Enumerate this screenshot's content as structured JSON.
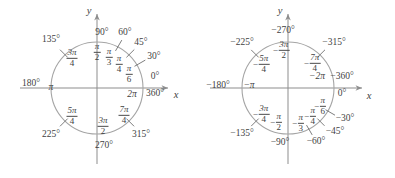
{
  "document": {
    "title": "Unit circle angle measures: positive and negative",
    "background_color": "#ffffff",
    "ink_color": "#3f3f3f",
    "circle_color": "#9a9a9a"
  },
  "figures": [
    {
      "id": "positive-angles",
      "name": "unit-circle-positive-angles",
      "center": {
        "x": 97,
        "y": 88
      },
      "radius": 46,
      "axis_labels": {
        "x": "x",
        "y": "y"
      },
      "points": [
        {
          "degrees": "0°",
          "radians_num": "2",
          "radians_den": "",
          "radians_plain": "2π",
          "angle": 0
        },
        {
          "degrees": "360°",
          "radians_num": "",
          "radians_den": "",
          "radians_plain": "",
          "angle": 0
        },
        {
          "degrees": "30°",
          "radians_num": "π",
          "radians_den": "6",
          "angle": 30
        },
        {
          "degrees": "45°",
          "radians_num": "π",
          "radians_den": "4",
          "angle": 45
        },
        {
          "degrees": "60°",
          "radians_num": "π",
          "radians_den": "3",
          "angle": 60
        },
        {
          "degrees": "90°",
          "radians_num": "π",
          "radians_den": "2",
          "angle": 90
        },
        {
          "degrees": "135°",
          "radians_num": "3π",
          "radians_den": "4",
          "angle": 135
        },
        {
          "degrees": "180°",
          "radians_plain": "π",
          "angle": 180
        },
        {
          "degrees": "225°",
          "radians_num": "5π",
          "radians_den": "4",
          "angle": 225
        },
        {
          "degrees": "270°",
          "radians_num": "3π",
          "radians_den": "2",
          "angle": 270
        },
        {
          "degrees": "315°",
          "radians_num": "7π",
          "radians_den": "4",
          "angle": 315
        }
      ],
      "labels": {
        "deg_0": "0°",
        "deg_30": "30°",
        "deg_45": "45°",
        "deg_60": "60°",
        "deg_90": "90°",
        "deg_135": "135°",
        "deg_180": "180°",
        "deg_225": "225°",
        "deg_270": "270°",
        "deg_315": "315°",
        "deg_360": "360°",
        "rad_2pi": "2π",
        "rad_pi": "π",
        "pi_sym": "π",
        "n_3pi": "3π",
        "n_5pi": "5π",
        "n_7pi": "7π",
        "d_2": "2",
        "d_3": "3",
        "d_4": "4",
        "d_6": "6"
      }
    },
    {
      "id": "negative-angles",
      "name": "unit-circle-negative-angles",
      "center": {
        "x": 90,
        "y": 88
      },
      "radius": 46,
      "axis_labels": {
        "x": "x",
        "y": "y"
      },
      "labels": {
        "deg_0": "0°",
        "deg_m30": "−30°",
        "deg_m45": "−45°",
        "deg_m60": "−60°",
        "deg_m90": "−90°",
        "deg_m135": "−135°",
        "deg_m180": "−180°",
        "deg_m225": "−225°",
        "deg_m270": "−270°",
        "deg_m315": "−315°",
        "deg_m360": "−360°",
        "rad_m2pi": "−2π",
        "rad_mpi": "−π",
        "minus": "−",
        "pi_sym": "π",
        "n_3pi": "3π",
        "n_5pi": "5π",
        "n_7pi": "7π",
        "d_2": "2",
        "d_3": "3",
        "d_4": "4",
        "d_6": "6"
      }
    }
  ]
}
